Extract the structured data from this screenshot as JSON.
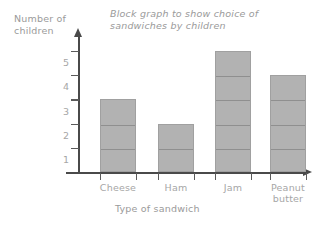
{
  "chart_data": {
    "type": "bar",
    "title": "Block graph to show choice of\nsandwiches by children",
    "xlabel": "Type of sandwich",
    "ylabel": "Number of\nchildren",
    "categories": [
      "Cheese",
      "Ham",
      "Jam",
      "Peanut\nbutter"
    ],
    "values": [
      3,
      2,
      5,
      4
    ],
    "ytick_labels": [
      "1",
      "2",
      "3",
      "4",
      "5"
    ],
    "ylim": [
      0,
      6
    ],
    "grid": false,
    "legend": "none",
    "style": "stacked unit blocks, each block = 1 child",
    "bar_color": "#b2b2b2",
    "bar_border_color": "#a0a0a0",
    "axis_color": "#4a4a4a",
    "text_color": "#a6a6a6"
  }
}
